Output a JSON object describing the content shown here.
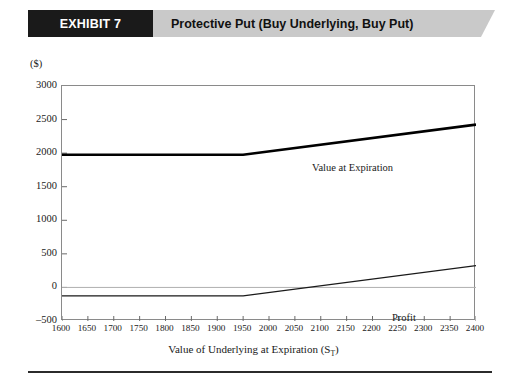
{
  "header": {
    "exhibit_label": "EXHIBIT 7",
    "title": "Protective Put (Buy Underlying, Buy Put)",
    "banner_black": "#1a1a1a",
    "banner_gray": "#c9c9c9"
  },
  "chart_data": {
    "type": "line",
    "title": "Protective Put (Buy Underlying, Buy Put)",
    "y_unit_label": "($)",
    "xlabel": "Value of Underlying at Expiration (S_T)",
    "xlabel_text": "Value of Underlying at Expiration (S",
    "xlabel_sub": "T",
    "xlabel_tail": ")",
    "ylabel": "",
    "xlim": [
      1600,
      2400
    ],
    "ylim": [
      -500,
      3000
    ],
    "x_ticks": [
      1600,
      1650,
      1700,
      1750,
      1800,
      1850,
      1900,
      1950,
      2000,
      2050,
      2100,
      2150,
      2200,
      2250,
      2300,
      2350,
      2400
    ],
    "y_ticks": [
      -500,
      0,
      500,
      1000,
      1500,
      2000,
      2500,
      3000
    ],
    "grid": false,
    "zero_line": true,
    "legend_position": "inline-annotation",
    "series": [
      {
        "name": "Value at Expiration",
        "style": "solid-thick",
        "color": "#000000",
        "x": [
          1600,
          1950,
          2400
        ],
        "values": [
          1975,
          1975,
          2425
        ]
      },
      {
        "name": "Profit",
        "style": "solid-thin",
        "color": "#1a1a1a",
        "x": [
          1600,
          1950,
          2400
        ],
        "values": [
          -125,
          -125,
          325
        ]
      }
    ],
    "annotations": [
      {
        "text": "Value at Expiration",
        "x": 2090,
        "y": 2250
      },
      {
        "text": "Profit",
        "x": 2250,
        "y": 185
      }
    ]
  },
  "axis": {
    "y_labels": [
      "3000",
      "2500",
      "2000",
      "1500",
      "1000",
      "500",
      "0",
      "-500"
    ],
    "x_labels": [
      "1600",
      "1650",
      "1700",
      "1750",
      "1800",
      "1850",
      "1900",
      "1950",
      "2000",
      "2050",
      "2100",
      "2150",
      "2200",
      "2250",
      "2300",
      "2350",
      "2400"
    ]
  }
}
